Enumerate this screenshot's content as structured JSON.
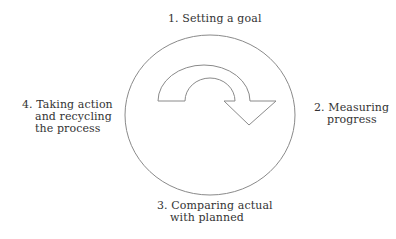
{
  "diagram": {
    "type": "cycle",
    "center_shape": "circle",
    "center_icon": "clockwise-curved-arrow",
    "colors": {
      "stroke": "#8a8a8a",
      "text": "#333333",
      "background": "#ffffff"
    },
    "steps": [
      {
        "number": "1.",
        "lines": [
          "1. Setting a goal"
        ]
      },
      {
        "number": "2.",
        "lines": [
          "2. Measuring",
          "progress"
        ]
      },
      {
        "number": "3.",
        "lines": [
          "3. Comparing actual",
          "with planned"
        ]
      },
      {
        "number": "4.",
        "lines": [
          "4. Taking action",
          "and recycling",
          "the process"
        ]
      }
    ]
  }
}
